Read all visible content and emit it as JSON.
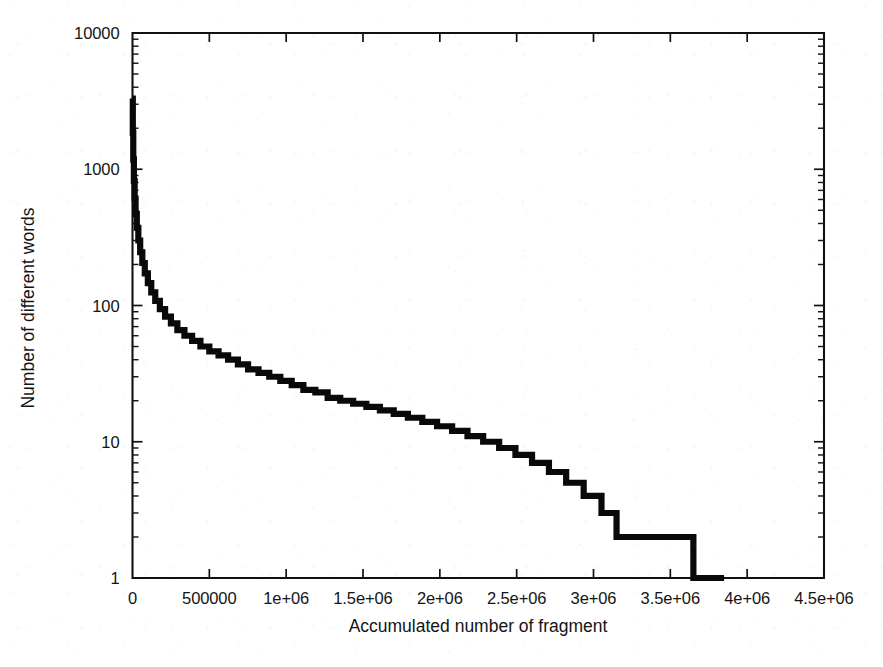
{
  "figure": {
    "title": "",
    "background_color": "#ffffff",
    "ink_color": "#0a0a0a"
  },
  "axis_titles": {
    "x": "Accumulated number of fragment",
    "y": "Number of different words"
  },
  "x_tick_labels": [
    "0",
    "500000",
    "1e+06",
    "1.5e+06",
    "2e+06",
    "2.5e+06",
    "3e+06",
    "3.5e+06",
    "4e+06",
    "4.5e+06"
  ],
  "y_tick_labels": [
    "1",
    "10",
    "100",
    "1000",
    "10000"
  ],
  "chart_data": {
    "type": "line",
    "title": "",
    "subtitle": "",
    "xlabel": "Accumulated number of fragment",
    "ylabel": "Number of different words",
    "xscale": "linear",
    "yscale": "log",
    "xlim": [
      0,
      4500000
    ],
    "ylim": [
      1,
      10000
    ],
    "xticks": [
      0,
      500000,
      1000000,
      1500000,
      2000000,
      2500000,
      3000000,
      3500000,
      4000000,
      4500000
    ],
    "xticklabels": [
      "0",
      "500000",
      "1e+06",
      "1.5e+06",
      "2e+06",
      "2.5e+06",
      "3e+06",
      "3.5e+06",
      "4e+06",
      "4.5e+06"
    ],
    "yticks": [
      1,
      10,
      100,
      1000,
      10000
    ],
    "yticklabels": [
      "1",
      "10",
      "100",
      "1000",
      "10000"
    ],
    "minor_ticks": true,
    "grid": false,
    "legend": null,
    "legend_position": "none",
    "annotations": [],
    "series": [
      {
        "name": "word frequency decay",
        "style": "step-post",
        "color": "#0a0a0a",
        "linewidth": 6.2,
        "x": [
          0,
          2000,
          5000,
          9000,
          14000,
          20000,
          28000,
          38000,
          50000,
          64000,
          80000,
          100000,
          122000,
          148000,
          178000,
          212000,
          250000,
          292000,
          338000,
          388000,
          442000,
          500000,
          560000,
          622000,
          686000,
          752000,
          820000,
          890000,
          962000,
          1036000,
          1112000,
          1190000,
          1270000,
          1352000,
          1436000,
          1522000,
          1610000,
          1700000,
          1792000,
          1886000,
          1982000,
          2080000,
          2180000,
          2282000,
          2386000,
          2492000,
          2600000,
          2710000,
          2822000,
          2936000,
          3052000,
          3150000,
          3400000,
          3650000,
          3850000
        ],
        "y": [
          3300,
          1850,
          1180,
          820,
          610,
          470,
          372,
          300,
          246,
          205,
          172,
          146,
          125,
          108,
          94,
          83,
          74,
          66,
          60,
          55,
          50,
          46,
          43,
          40,
          37,
          34,
          32,
          30,
          28,
          26,
          24,
          23,
          21,
          20,
          19,
          18,
          17,
          16,
          15,
          14,
          13,
          12,
          11,
          10,
          9,
          8,
          7,
          6,
          5,
          4,
          3,
          2,
          2,
          1,
          1
        ]
      }
    ]
  }
}
